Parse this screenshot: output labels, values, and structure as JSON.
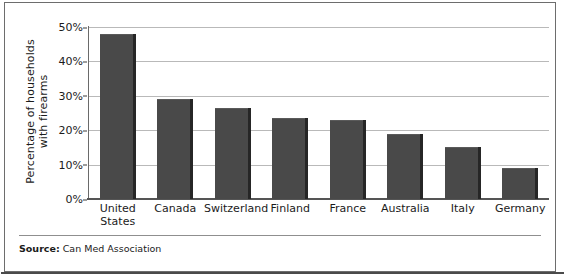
{
  "chart_data": {
    "type": "bar",
    "title": "",
    "xlabel": "",
    "ylabel": "Percentage of households\nwith firearms",
    "categories": [
      "United\nStates",
      "Canada",
      "Switzerland",
      "Finland",
      "France",
      "Australia",
      "Italy",
      "Germany"
    ],
    "values": [
      48,
      29,
      26.5,
      23.5,
      23,
      19,
      15,
      9
    ],
    "ylim": [
      0,
      50
    ],
    "ytick_values": [
      0,
      10,
      20,
      30,
      40,
      50
    ],
    "ytick_labels": [
      "0%",
      "10%",
      "20%",
      "30%",
      "40%",
      "50%"
    ],
    "grid": true,
    "legend": false,
    "bar_color": "#494949",
    "gridline_color": "#b9b9b9",
    "axis_color": "#555555"
  },
  "source": {
    "label": "Source:",
    "text": "Can Med Association"
  }
}
